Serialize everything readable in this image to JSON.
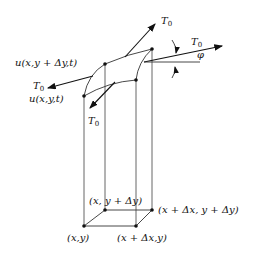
{
  "diagram": {
    "labels": {
      "u_top": "u(x,y + Δy,t)",
      "u_bottom": "u(x,y,t)",
      "tension_left": "T",
      "tension_left_sub": "0",
      "tension_top": "T",
      "tension_top_sub": "0",
      "tension_right": "T",
      "tension_right_sub": "0",
      "tension_down": "T",
      "tension_down_sub": "0",
      "angle": "φ",
      "corner_xy": "(x,y)",
      "corner_x_dx_y": "(x + Δx,y)",
      "corner_x_y_dy": "(x, y + Δy)",
      "corner_x_dx_y_dy": "(x + Δx, y + Δy)"
    },
    "colors": {
      "line": "#222222",
      "thin_line": "#555555",
      "background": "#ffffff"
    }
  }
}
